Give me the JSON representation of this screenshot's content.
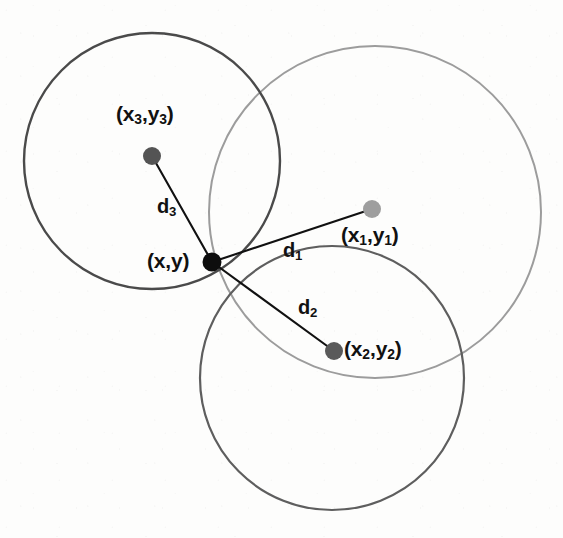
{
  "figure": {
    "kind": "trilateration-diagram",
    "width": 563,
    "height": 538,
    "background_color": "#fdfdfc"
  },
  "colors": {
    "circle_1_stroke": "#9c9c9c",
    "circle_2_stroke": "#5e5e5e",
    "circle_3_stroke": "#4a4a4a",
    "line_stroke": "#111111",
    "anchor_1_fill": "#9e9e9e",
    "anchor_2_fill": "#5a5a5a",
    "anchor_3_fill": "#545454",
    "target_fill": "#0d0d0d",
    "label_color": "#111111"
  },
  "circles": [
    {
      "id": "circle-1",
      "center_label": "(x1,y1)",
      "cx": 375,
      "cy": 212,
      "r": 166,
      "stroke": "#9c9c9c",
      "stroke_width": 2.0
    },
    {
      "id": "circle-2",
      "center_label": "(x2,y2)",
      "cx": 332,
      "cy": 378,
      "r": 132,
      "stroke": "#5e5e5e",
      "stroke_width": 2.2
    },
    {
      "id": "circle-3",
      "center_label": "(x3,y3)",
      "cx": 152,
      "cy": 161,
      "r": 128,
      "stroke": "#4a4a4a",
      "stroke_width": 2.4
    }
  ],
  "points": [
    {
      "id": "anchor-1",
      "label": "(x1,y1)",
      "label_base": "(x",
      "label_sub": "1",
      "label_mid": ",y",
      "label_sub2": "1",
      "label_end": ")",
      "cx": 372,
      "cy": 209,
      "r": 9,
      "fill": "#9e9e9e",
      "label_x": 341,
      "label_y": 226
    },
    {
      "id": "anchor-2",
      "label": "(x2,y2)",
      "label_base": "(x",
      "label_sub": "2",
      "label_mid": ",y",
      "label_sub2": "2",
      "label_end": ")",
      "cx": 334,
      "cy": 351,
      "r": 9,
      "fill": "#5a5a5a",
      "label_x": 344,
      "label_y": 340
    },
    {
      "id": "anchor-3",
      "label": "(x3,y3)",
      "label_base": "(x",
      "label_sub": "3",
      "label_mid": ",y",
      "label_sub2": "3",
      "label_end": ")",
      "cx": 152,
      "cy": 156,
      "r": 9,
      "fill": "#545454",
      "label_x": 116,
      "label_y": 113
    },
    {
      "id": "target",
      "label": "(x,y)",
      "cx": 212,
      "cy": 262,
      "r": 9.5,
      "fill": "#0d0d0d",
      "label_x": 147,
      "label_y": 248
    }
  ],
  "distances": [
    {
      "id": "d1",
      "label_base": "d",
      "label_sub": "1",
      "from": {
        "x": 212,
        "y": 262
      },
      "to": {
        "x": 372,
        "y": 209
      },
      "label_x": 283,
      "label_y": 240
    },
    {
      "id": "d2",
      "label_base": "d",
      "label_sub": "2",
      "from": {
        "x": 212,
        "y": 262
      },
      "to": {
        "x": 334,
        "y": 351
      },
      "label_x": 298,
      "label_y": 297
    },
    {
      "id": "d3",
      "label_base": "d",
      "label_sub": "3",
      "from": {
        "x": 212,
        "y": 262
      },
      "to": {
        "x": 152,
        "y": 156
      },
      "label_x": 157,
      "label_y": 196
    }
  ],
  "chart_data": {
    "type": "scatter",
    "title": "",
    "xlabel": "",
    "ylabel": "",
    "annotations": [
      "(x,y)",
      "(x1,y1)",
      "(x2,y2)",
      "(x3,y3)",
      "d1",
      "d2",
      "d3"
    ],
    "series": [
      {
        "name": "anchors",
        "points": [
          {
            "label": "(x1,y1)",
            "x": 372,
            "y": 209,
            "radius": 166
          },
          {
            "label": "(x2,y2)",
            "x": 334,
            "y": 351,
            "radius": 132
          },
          {
            "label": "(x3,y3)",
            "x": 152,
            "y": 156,
            "radius": 128
          }
        ]
      },
      {
        "name": "target",
        "points": [
          {
            "label": "(x,y)",
            "x": 212,
            "y": 262
          }
        ]
      }
    ],
    "grid": false,
    "legend": "none"
  }
}
